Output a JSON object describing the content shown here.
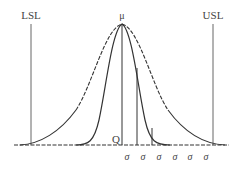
{
  "diagram": {
    "type": "process-capability-normal-curves",
    "labels": {
      "lsl": "LSL",
      "usl": "USL",
      "mean": "μ",
      "q": "Q",
      "sigma_ticks": [
        "σ",
        "σ",
        "σ",
        "σ",
        "σ",
        "σ"
      ]
    },
    "curves": [
      {
        "name": "wide-distribution",
        "style": "solid-lower / dashed-upper"
      },
      {
        "name": "narrow-distribution",
        "style": "solid"
      }
    ],
    "colors": {
      "line": "#333333",
      "text": "#444444",
      "background": "#ffffff"
    }
  }
}
